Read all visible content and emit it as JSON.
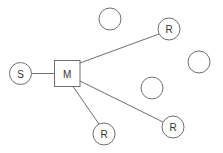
{
  "diagram": {
    "stroke_color": "#6e6e6e",
    "label_color": "#333333",
    "nodes": [
      {
        "id": "S",
        "label": "S",
        "shape": "circle",
        "cx": 20.5,
        "cy": 73.5,
        "r": 11
      },
      {
        "id": "M",
        "label": "M",
        "shape": "square",
        "x": 54.5,
        "y": 60.5,
        "w": 25.5,
        "h": 26
      },
      {
        "id": "E1",
        "label": "",
        "shape": "circle",
        "cx": 110,
        "cy": 19,
        "r": 11
      },
      {
        "id": "R1",
        "label": "R",
        "shape": "circle",
        "cx": 169,
        "cy": 29,
        "r": 11
      },
      {
        "id": "E2",
        "label": "",
        "shape": "circle",
        "cx": 199,
        "cy": 62,
        "r": 11
      },
      {
        "id": "E3",
        "label": "",
        "shape": "circle",
        "cx": 152,
        "cy": 88,
        "r": 11
      },
      {
        "id": "R2",
        "label": "R",
        "shape": "circle",
        "cx": 173,
        "cy": 127,
        "r": 11
      },
      {
        "id": "R3",
        "label": "R",
        "shape": "circle",
        "cx": 104,
        "cy": 134,
        "r": 11
      }
    ],
    "edges": [
      {
        "from": "S",
        "to": "M",
        "x1": 31.5,
        "y1": 73.5,
        "x2": 54.5,
        "y2": 73.5
      },
      {
        "from": "M",
        "to": "R1",
        "x1": 80,
        "y1": 63,
        "x2": 159,
        "y2": 34
      },
      {
        "from": "M",
        "to": "R2",
        "x1": 80,
        "y1": 81,
        "x2": 163,
        "y2": 122
      },
      {
        "from": "M",
        "to": "R3",
        "x1": 73,
        "y1": 86.5,
        "x2": 99,
        "y2": 124
      }
    ]
  }
}
